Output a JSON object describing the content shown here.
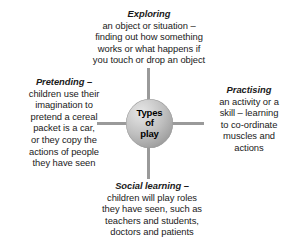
{
  "diagram": {
    "title": "Types of play",
    "type": "hub-and-spoke concept map",
    "hub": {
      "line1": "Types",
      "line2": "of",
      "line3": "play"
    },
    "branches": {
      "exploring": {
        "heading": "Exploring",
        "lines": [
          "an object or situation –",
          "finding out how something",
          "works or what happens if",
          "you touch or drop an object"
        ]
      },
      "pretending": {
        "heading": "Pretending –",
        "lines": [
          "children use their",
          "imagination to",
          "pretend a cereal",
          "packet is a car,",
          "or they copy the",
          "actions of people",
          "they have seen"
        ]
      },
      "practising": {
        "heading": "Practising",
        "lines": [
          "an activity or a",
          "skill – learning",
          "to co-ordinate",
          "muscles and",
          "actions"
        ]
      },
      "social_learning": {
        "heading": "Social learning –",
        "lines": [
          "children will play roles",
          "they have seen, such as",
          "teachers and students,",
          "doctors and patients"
        ]
      }
    },
    "colors": {
      "background": "#ffffff",
      "text": "#1a1a1a",
      "spoke": "#9a9a9a",
      "hub_light": "#e6e6e6",
      "hub_dark": "#828282"
    }
  }
}
